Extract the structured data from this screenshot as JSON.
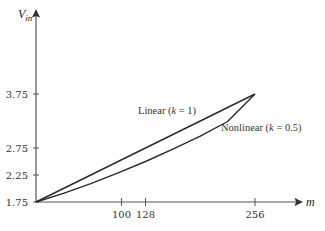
{
  "chart_data": {
    "type": "line",
    "title": "",
    "xlabel": "m",
    "ylabel": "V",
    "ylabel_subscript": "in",
    "x_ticks": [
      100,
      128,
      256
    ],
    "x_tick_labels": [
      "100",
      "128",
      "256"
    ],
    "y_ticks": [
      1.75,
      2.25,
      2.75,
      3.75
    ],
    "y_tick_labels": [
      "1.75",
      "2.25",
      "2.75",
      "3.75"
    ],
    "xlim": [
      0,
      256
    ],
    "ylim": [
      1.75,
      3.75
    ],
    "grid": false,
    "series": [
      {
        "name": "Linear (k = 1)",
        "k": 1,
        "x": [
          0,
          32,
          64,
          96,
          128,
          160,
          192,
          224,
          256
        ],
        "y": [
          1.75,
          2.0,
          2.25,
          2.5,
          2.75,
          3.0,
          3.25,
          3.5,
          3.75
        ]
      },
      {
        "name": "Nonlinear (k = 0.5)",
        "k": 0.5,
        "x": [
          0,
          32,
          64,
          96,
          128,
          160,
          192,
          224,
          256
        ],
        "y": [
          1.75,
          1.91,
          2.09,
          2.29,
          2.5,
          2.73,
          2.97,
          3.24,
          3.75
        ]
      }
    ],
    "annotations": [
      {
        "text_prefix": "Linear (",
        "k_symbol": "k",
        "text_suffix": " = 1)"
      },
      {
        "text_prefix": "Nonlinear (",
        "k_symbol": "k",
        "text_suffix": " = 0.5)"
      }
    ]
  }
}
